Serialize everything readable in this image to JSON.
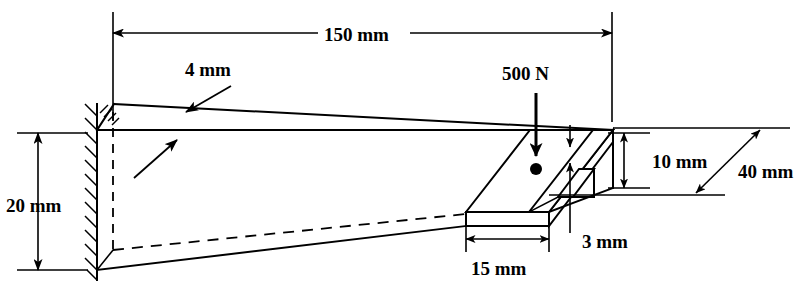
{
  "figure": {
    "background_color": "#ffffff",
    "line_color": "#000000"
  },
  "dimensions": {
    "length": {
      "label": "150 mm",
      "value": 150,
      "unit": "mm",
      "orientation": "horizontal",
      "location": "top"
    },
    "height_at_wall": {
      "label": "20 mm",
      "value": 20,
      "unit": "mm",
      "orientation": "vertical",
      "location": "left"
    },
    "top_plate_thickness": {
      "label": "4 mm",
      "value": 4,
      "unit": "mm",
      "orientation": "leader",
      "location": "upper-left"
    },
    "plate_width": {
      "label": "15 mm",
      "value": 15,
      "unit": "mm",
      "orientation": "horizontal",
      "location": "bottom-right"
    },
    "flange_height": {
      "label": "10 mm",
      "value": 10,
      "unit": "mm",
      "orientation": "vertical",
      "location": "right"
    },
    "flange_thickness": {
      "label": "3 mm",
      "value": 3,
      "unit": "mm",
      "orientation": "leader",
      "location": "bottom-right"
    },
    "depth": {
      "label": "40 mm",
      "value": 40,
      "unit": "mm",
      "orientation": "diagonal",
      "location": "far-right"
    }
  },
  "load": {
    "label": "500 N",
    "value": 500,
    "unit": "N",
    "direction": "downward",
    "type": "point-load"
  },
  "support": {
    "type": "fixed-wall",
    "location": "left-end",
    "hatching": true
  }
}
